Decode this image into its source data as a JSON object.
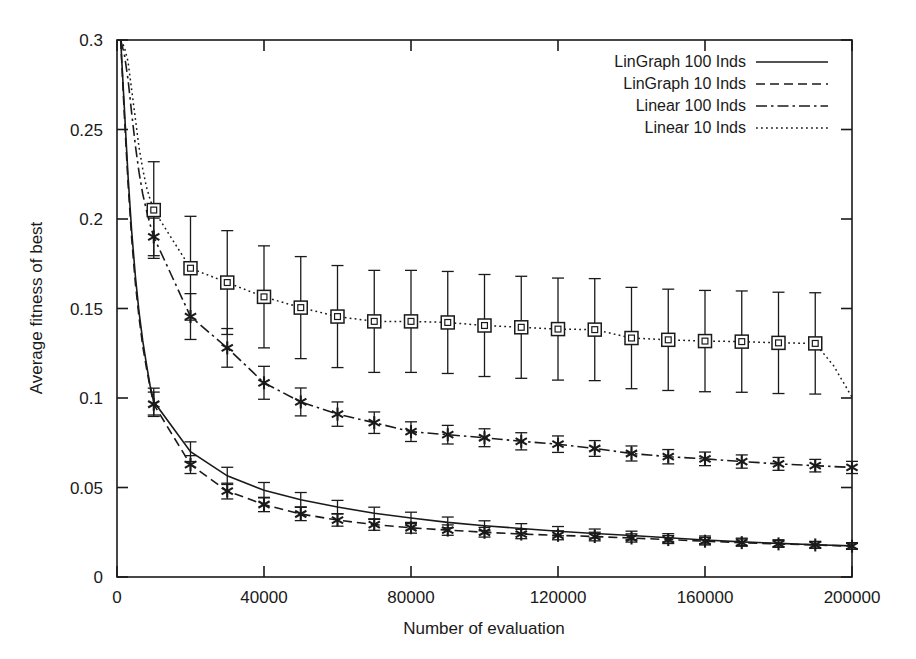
{
  "chart_data": {
    "type": "line",
    "title": "",
    "xlabel": "Number of evaluation",
    "ylabel": "Average fitness of best",
    "xlim": [
      0,
      200000
    ],
    "ylim": [
      0,
      0.3
    ],
    "xticks": [
      0,
      40000,
      80000,
      120000,
      160000,
      200000
    ],
    "xticklabels": [
      "0",
      "40000",
      "80000",
      "120000",
      "160000",
      "200000"
    ],
    "yticks": [
      0,
      0.05,
      0.1,
      0.15,
      0.2,
      0.25,
      0.3
    ],
    "yticklabels": [
      "0",
      "0.05",
      "0.1",
      "0.15",
      "0.2",
      "0.25",
      "0.3"
    ],
    "grid": false,
    "legend_position": "top-right",
    "error_bars": true,
    "series": [
      {
        "name": "LinGraph 100 Inds",
        "style": "solid",
        "marker": "none",
        "x": [
          1000,
          2000,
          3000,
          4000,
          5000,
          6000,
          7000,
          8000,
          9000,
          10000,
          20000,
          30000,
          40000,
          50000,
          60000,
          70000,
          80000,
          90000,
          100000,
          110000,
          120000,
          130000,
          140000,
          150000,
          160000,
          170000,
          180000,
          190000,
          200000
        ],
        "values": [
          0.3,
          0.262,
          0.224,
          0.193,
          0.168,
          0.148,
          0.132,
          0.119,
          0.107,
          0.098,
          0.07,
          0.0565,
          0.0485,
          0.0432,
          0.0391,
          0.0356,
          0.033,
          0.0305,
          0.0286,
          0.0271,
          0.0256,
          0.0243,
          0.0232,
          0.0219,
          0.0207,
          0.0196,
          0.0188,
          0.018,
          0.0174
        ],
        "marker_x": [
          10000,
          20000,
          30000,
          40000,
          50000,
          60000,
          70000,
          80000,
          90000,
          100000,
          110000,
          120000,
          130000,
          140000,
          150000,
          160000,
          170000,
          180000,
          190000,
          200000
        ],
        "marker_y": [
          0.098,
          0.07,
          0.0565,
          0.0485,
          0.0432,
          0.0391,
          0.0356,
          0.033,
          0.0305,
          0.0286,
          0.0271,
          0.0256,
          0.0243,
          0.0232,
          0.0219,
          0.0207,
          0.0196,
          0.0188,
          0.018,
          0.0174
        ],
        "err": [
          0.0075,
          0.0055,
          0.0048,
          0.0043,
          0.004,
          0.0037,
          0.0034,
          0.0032,
          0.003,
          0.0028,
          0.0027,
          0.0026,
          0.0025,
          0.0024,
          0.0023,
          0.0022,
          0.0021,
          0.002,
          0.0019,
          0.0018
        ]
      },
      {
        "name": "LinGraph 10 Inds",
        "style": "dashed",
        "marker": "star",
        "x": [
          1000,
          2000,
          3000,
          4000,
          5000,
          6000,
          7000,
          8000,
          9000,
          10000,
          20000,
          30000,
          40000,
          50000,
          60000,
          70000,
          80000,
          90000,
          100000,
          110000,
          120000,
          130000,
          140000,
          150000,
          160000,
          170000,
          180000,
          190000,
          200000
        ],
        "values": [
          0.3,
          0.258,
          0.22,
          0.189,
          0.164,
          0.145,
          0.129,
          0.117,
          0.106,
          0.0965,
          0.0628,
          0.048,
          0.0405,
          0.0352,
          0.0318,
          0.0293,
          0.0275,
          0.0262,
          0.025,
          0.024,
          0.0233,
          0.0226,
          0.0218,
          0.0209,
          0.02,
          0.0192,
          0.0185,
          0.0179,
          0.0172
        ],
        "marker_x": [
          10000,
          20000,
          30000,
          40000,
          50000,
          60000,
          70000,
          80000,
          90000,
          100000,
          110000,
          120000,
          130000,
          140000,
          150000,
          160000,
          170000,
          180000,
          190000,
          200000
        ],
        "marker_y": [
          0.0965,
          0.0628,
          0.048,
          0.0405,
          0.0352,
          0.0318,
          0.0293,
          0.0275,
          0.0262,
          0.025,
          0.024,
          0.0233,
          0.0226,
          0.0218,
          0.0209,
          0.02,
          0.0192,
          0.0185,
          0.0179,
          0.0172
        ],
        "err": [
          0.0068,
          0.005,
          0.0044,
          0.004,
          0.0037,
          0.0034,
          0.0032,
          0.003,
          0.0029,
          0.0027,
          0.0026,
          0.0025,
          0.0024,
          0.0023,
          0.0022,
          0.0021,
          0.002,
          0.0019,
          0.0018,
          0.0017
        ]
      },
      {
        "name": "Linear 100 Inds",
        "style": "dashdot",
        "marker": "star",
        "x": [
          1000,
          2000,
          3000,
          4000,
          5000,
          6000,
          7000,
          8000,
          9000,
          10000,
          20000,
          30000,
          40000,
          50000,
          60000,
          70000,
          80000,
          90000,
          100000,
          110000,
          120000,
          130000,
          140000,
          150000,
          160000,
          170000,
          180000,
          190000,
          200000
        ],
        "values": [
          0.3,
          0.292,
          0.278,
          0.259,
          0.241,
          0.226,
          0.214,
          0.205,
          0.197,
          0.19,
          0.1455,
          0.128,
          0.1085,
          0.0978,
          0.091,
          0.0862,
          0.0812,
          0.0795,
          0.0778,
          0.0758,
          0.0742,
          0.0718,
          0.069,
          0.0672,
          0.066,
          0.0645,
          0.0632,
          0.0622,
          0.0612
        ],
        "marker_x": [
          10000,
          20000,
          30000,
          40000,
          50000,
          60000,
          70000,
          80000,
          90000,
          100000,
          110000,
          120000,
          130000,
          140000,
          150000,
          160000,
          170000,
          180000,
          190000,
          200000
        ],
        "marker_y": [
          0.19,
          0.1455,
          0.128,
          0.1085,
          0.0978,
          0.091,
          0.0862,
          0.0812,
          0.0795,
          0.0778,
          0.0758,
          0.0742,
          0.0718,
          0.069,
          0.0672,
          0.066,
          0.0645,
          0.0632,
          0.0622,
          0.0612
        ],
        "err": [
          0.0105,
          0.0128,
          0.0108,
          0.0092,
          0.0078,
          0.0068,
          0.006,
          0.0055,
          0.0052,
          0.005,
          0.0048,
          0.0046,
          0.0044,
          0.0042,
          0.004,
          0.0038,
          0.0037,
          0.0036,
          0.0035,
          0.0034
        ]
      },
      {
        "name": "Linear 10 Inds",
        "style": "dotted",
        "marker": "square",
        "x": [
          1000,
          2000,
          3000,
          4000,
          5000,
          6000,
          7000,
          8000,
          9000,
          10000,
          20000,
          30000,
          40000,
          50000,
          60000,
          70000,
          80000,
          90000,
          100000,
          110000,
          120000,
          130000,
          140000,
          150000,
          160000,
          170000,
          180000,
          190000,
          195000,
          200000
        ],
        "values": [
          0.3,
          0.296,
          0.288,
          0.272,
          0.256,
          0.24,
          0.228,
          0.218,
          0.211,
          0.205,
          0.1725,
          0.1645,
          0.1565,
          0.1505,
          0.1455,
          0.1428,
          0.1428,
          0.1422,
          0.1405,
          0.1395,
          0.1385,
          0.1382,
          0.1335,
          0.1325,
          0.1318,
          0.1315,
          0.1308,
          0.1305,
          0.118,
          0.1005
        ],
        "marker_x": [
          10000,
          20000,
          30000,
          40000,
          50000,
          60000,
          70000,
          80000,
          90000,
          100000,
          110000,
          120000,
          130000,
          140000,
          150000,
          160000,
          170000,
          180000,
          190000
        ],
        "marker_y": [
          0.205,
          0.1725,
          0.1645,
          0.1565,
          0.1505,
          0.1455,
          0.1428,
          0.1428,
          0.1422,
          0.1405,
          0.1395,
          0.1385,
          0.1382,
          0.1335,
          0.1325,
          0.1318,
          0.1315,
          0.1308,
          0.1305
        ],
        "err": [
          0.027,
          0.029,
          0.029,
          0.0285,
          0.0285,
          0.0285,
          0.0285,
          0.0285,
          0.0285,
          0.0285,
          0.0285,
          0.0285,
          0.0285,
          0.0283,
          0.0283,
          0.0283,
          0.0283,
          0.0283,
          0.0283
        ]
      }
    ]
  },
  "legend": {
    "entries": [
      {
        "label": "LinGraph 100 Inds",
        "style": "solid"
      },
      {
        "label": "LinGraph 10 Inds",
        "style": "dashed"
      },
      {
        "label": "Linear 100 Inds",
        "style": "dashdot"
      },
      {
        "label": "Linear 10 Inds",
        "style": "dotted"
      }
    ]
  },
  "colors": {
    "ink": "#1a1a1a",
    "background": "#ffffff",
    "frame": "#1a1a1a"
  }
}
